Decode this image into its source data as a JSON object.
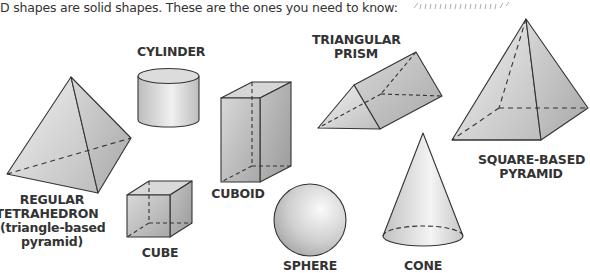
{
  "intro_text": "D shapes are solid shapes.  These are the ones you need to know:",
  "colors": {
    "fill_light": "#e8e8e8",
    "fill_mid": "#cfcfcf",
    "fill_dark": "#a9a9a9",
    "stroke": "#333333",
    "text": "#333333"
  },
  "shapes": [
    {
      "id": "tetrahedron",
      "label_lines": [
        "REGULAR",
        "TETRAHEDRON",
        "(triangle-based",
        "pyramid)"
      ]
    },
    {
      "id": "cylinder",
      "label_lines": [
        "CYLINDER"
      ]
    },
    {
      "id": "cube",
      "label_lines": [
        "CUBE"
      ]
    },
    {
      "id": "cuboid",
      "label_lines": [
        "CUBOID"
      ]
    },
    {
      "id": "sphere",
      "label_lines": [
        "SPHERE"
      ]
    },
    {
      "id": "triangular-prism",
      "label_lines": [
        "TRIANGULAR",
        "PRISM"
      ]
    },
    {
      "id": "cone",
      "label_lines": [
        "CONE"
      ]
    },
    {
      "id": "square-based-pyramid",
      "label_lines": [
        "SQUARE-BASED",
        "PYRAMID"
      ]
    }
  ]
}
